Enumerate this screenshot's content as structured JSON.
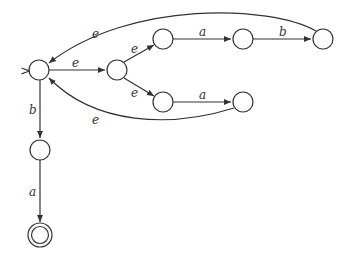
{
  "diagram": {
    "type": "finite-automaton",
    "start_marker": ">",
    "states": [
      {
        "id": "q0",
        "x": 39,
        "y": 70,
        "start": true,
        "accepting": false
      },
      {
        "id": "q1",
        "x": 117,
        "y": 70,
        "accepting": false
      },
      {
        "id": "q2",
        "x": 163,
        "y": 39,
        "accepting": false
      },
      {
        "id": "q3",
        "x": 243,
        "y": 39,
        "accepting": false
      },
      {
        "id": "q4",
        "x": 323,
        "y": 39,
        "accepting": false
      },
      {
        "id": "q5",
        "x": 163,
        "y": 102,
        "accepting": false
      },
      {
        "id": "q6",
        "x": 243,
        "y": 102,
        "accepting": false
      },
      {
        "id": "q7",
        "x": 40,
        "y": 150,
        "accepting": false
      },
      {
        "id": "q8",
        "x": 40,
        "y": 235,
        "accepting": true
      }
    ],
    "transitions": [
      {
        "from": "q0",
        "to": "q1",
        "label": "e"
      },
      {
        "from": "q1",
        "to": "q2",
        "label": "e"
      },
      {
        "from": "q1",
        "to": "q5",
        "label": "e"
      },
      {
        "from": "q2",
        "to": "q3",
        "label": "a"
      },
      {
        "from": "q3",
        "to": "q4",
        "label": "b"
      },
      {
        "from": "q4",
        "to": "q0",
        "label": "e"
      },
      {
        "from": "q5",
        "to": "q6",
        "label": "a"
      },
      {
        "from": "q6",
        "to": "q0",
        "label": "e"
      },
      {
        "from": "q0",
        "to": "q7",
        "label": "b"
      },
      {
        "from": "q7",
        "to": "q8",
        "label": "a"
      }
    ],
    "labels": {
      "t_q0_q1": "e",
      "t_q1_q2": "e",
      "t_q1_q5": "e",
      "t_q2_q3": "a",
      "t_q3_q4": "b",
      "t_q4_q0": "e",
      "t_q5_q6": "a",
      "t_q6_q0": "e",
      "t_q0_q7": "b",
      "t_q7_q8": "a",
      "start": ">"
    }
  }
}
